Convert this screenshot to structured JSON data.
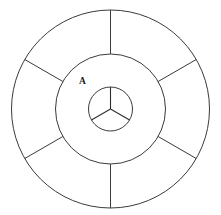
{
  "figure": {
    "background_color": "#ffffff",
    "stroke_color": "#3a3a3a",
    "label_color": "#1a1a1a",
    "center": {
      "x": 110.5,
      "y": 109.0
    },
    "labels": [
      {
        "text": "A",
        "x": 79,
        "y": 84
      }
    ]
  },
  "chart_data": {
    "type": "pie",
    "xlabel": "",
    "ylabel": "",
    "grid": false,
    "legend": "none",
    "center": {
      "x": 110.5,
      "y": 109.0
    },
    "rings": [
      {
        "name": "outer-ring",
        "inner_radius": 55,
        "outer_radius": 99,
        "sector_count": 6,
        "divider_angles_deg": [
          30,
          90,
          150,
          210,
          270,
          330
        ],
        "sector_span_deg": 60,
        "values": [
          60,
          60,
          60,
          60,
          60,
          60
        ]
      },
      {
        "name": "middle-annulus",
        "inner_radius": 22,
        "outer_radius": 55,
        "sector_count": 1,
        "divider_angles_deg": [],
        "sector_span_deg": 360,
        "values": [
          360
        ],
        "label": "A"
      },
      {
        "name": "inner-circle",
        "inner_radius": 0,
        "outer_radius": 22,
        "sector_count": 3,
        "divider_angles_deg": [
          90,
          210,
          330
        ],
        "sector_span_deg": 120,
        "values": [
          120,
          120,
          120
        ]
      }
    ],
    "circles": [
      {
        "name": "outer-circle",
        "radius": 99
      },
      {
        "name": "middle-circle",
        "radius": 55
      },
      {
        "name": "inner-circle",
        "radius": 22
      }
    ]
  }
}
